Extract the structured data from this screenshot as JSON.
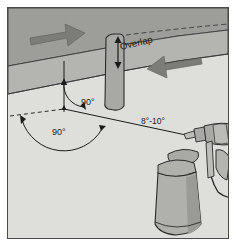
{
  "figure": {
    "frame_color": "#4a4a4a",
    "background_color": "#e9e9e6"
  },
  "labels": {
    "overlap": "Overlap",
    "angle_to_surface_vertical": "90°",
    "angle_to_surface_horizontal": "90°",
    "gun_travel_angle": "8°-10°"
  },
  "colors": {
    "band_fill": "#9d9d9a",
    "band_fill_light": "#b4b4b1",
    "surface_fill": "#dededa",
    "arrow_fill": "#7c7c79",
    "gun_body": "#a9a9a6",
    "gun_body_dark": "#8a8a87",
    "gun_cup": "#b0b0ad",
    "line": "#2b2b2b",
    "ghost_text": "#d8d8d4"
  },
  "elements": {
    "band_upper": "spray pass band, upper",
    "band_lower": "spray pass band, lower",
    "arrow_left": "direction arrow pointing right",
    "arrow_right": "direction arrow pointing left",
    "overlap_dimension": "double-headed vertical dimension arrow",
    "vertical_reference_line": "perpendicular reference line to surface",
    "dashed_reference_line": "dashed horizontal reference line",
    "spray_gun": "handheld spray gun with paint cup and power cord",
    "spray_axis_line": "line from nozzle tip to surface contact point"
  },
  "ghost_text": [
    "rodustrio de dece",
    "Cheksos sin parte",
    "no seran parte",
    "han base sul titolo",
    "contango de sembla",
    "e flame sa nove",
    "cor madeira e nuova",
    "so svalutory to dare sin pr",
    "lo crea en la sona"
  ]
}
